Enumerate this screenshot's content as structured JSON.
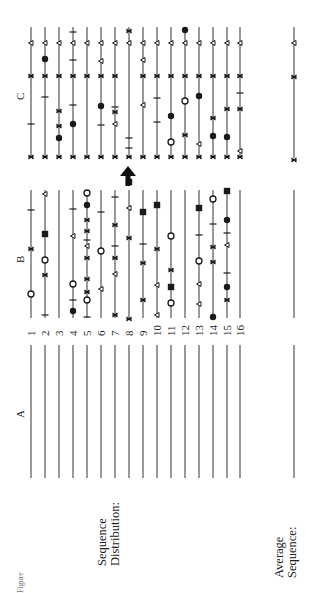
{
  "figure": {
    "orientation": "rotated-90-ccw",
    "panels": {
      "A": {
        "label": "A"
      },
      "B": {
        "label": "B"
      },
      "C": {
        "label": "C"
      }
    },
    "row_labels": [
      "1",
      "2",
      "3",
      "4",
      "5",
      "6",
      "7",
      "8",
      "9",
      "10",
      "11",
      "12",
      "13",
      "14",
      "15",
      "16"
    ],
    "sequence_distribution_label_1": "Sequence",
    "sequence_distribution_label_2": "Distribution:",
    "average_sequence_label_1": "Average",
    "average_sequence_label_2": "Sequence:",
    "caption": "Figure",
    "arrow": {
      "target_row": 8,
      "direction": "up"
    },
    "legend_markers": [
      "filled-circle",
      "open-circle",
      "filled-square",
      "open-triangle",
      "cross-x",
      "tick-bar"
    ],
    "colors": {
      "ink": "#1a1a1a",
      "line": "#555555",
      "background": "#ffffff"
    }
  },
  "geometry": {
    "line_x": [
      31,
      45,
      59,
      73,
      87,
      101,
      115,
      129,
      143,
      157,
      171,
      185,
      199,
      213,
      227,
      240
    ],
    "avg_x": 294,
    "C": {
      "y0": 27,
      "y1": 158
    },
    "B": {
      "y0": 190,
      "y1": 318
    },
    "A": {
      "y0": 345,
      "y1": 478
    }
  },
  "markers": {
    "C": [
      [
        [
          "tri",
          43
        ],
        [
          "x",
          76
        ],
        [
          "bar",
          124
        ],
        [
          "x",
          157
        ]
      ],
      [
        [
          "tri",
          43
        ],
        [
          "dot",
          59
        ],
        [
          "x",
          76
        ],
        [
          "bar",
          97
        ],
        [
          "x",
          157
        ]
      ],
      [
        [
          "tri",
          43
        ],
        [
          "x",
          76
        ],
        [
          "x",
          111
        ],
        [
          "x",
          126
        ],
        [
          "dot",
          138
        ],
        [
          "x",
          157
        ]
      ],
      [
        [
          "bar",
          32
        ],
        [
          "tri",
          43
        ],
        [
          "bar",
          60
        ],
        [
          "x",
          76
        ],
        [
          "bar",
          105
        ],
        [
          "dot",
          124
        ],
        [
          "x",
          157
        ]
      ],
      [
        [
          "tri",
          43
        ],
        [
          "x",
          76
        ],
        [
          "x",
          157
        ]
      ],
      [
        [
          "tri",
          43
        ],
        [
          "tri",
          61
        ],
        [
          "x",
          76
        ],
        [
          "dot",
          106
        ],
        [
          "bar",
          125
        ],
        [
          "x",
          157
        ]
      ],
      [
        [
          "tri",
          43
        ],
        [
          "x",
          76
        ],
        [
          "bar",
          107
        ],
        [
          "x",
          112
        ],
        [
          "tri",
          124
        ],
        [
          "x",
          157
        ]
      ],
      [
        [
          "x",
          31
        ],
        [
          "tri",
          43
        ],
        [
          "bar",
          138
        ],
        [
          "bar",
          148
        ],
        [
          "x",
          157
        ]
      ],
      [
        [
          "tri",
          43
        ],
        [
          "tri",
          60
        ],
        [
          "x",
          76
        ],
        [
          "tri",
          105
        ],
        [
          "x",
          157
        ]
      ],
      [
        [
          "tri",
          43
        ],
        [
          "x",
          76
        ],
        [
          "bar",
          98
        ],
        [
          "bar",
          122
        ],
        [
          "x",
          157
        ]
      ],
      [
        [
          "tri",
          43
        ],
        [
          "x",
          76
        ],
        [
          "dot",
          116
        ],
        [
          "circ",
          142
        ],
        [
          "x",
          157
        ]
      ],
      [
        [
          "dot",
          30
        ],
        [
          "tri",
          43
        ],
        [
          "x",
          76
        ],
        [
          "circ",
          101
        ],
        [
          "x",
          135
        ],
        [
          "x",
          157
        ]
      ],
      [
        [
          "tri",
          43
        ],
        [
          "x",
          76
        ],
        [
          "dot",
          96
        ],
        [
          "tri",
          144
        ],
        [
          "x",
          157
        ]
      ],
      [
        [
          "tri",
          43
        ],
        [
          "x",
          76
        ],
        [
          "x",
          118
        ],
        [
          "dot",
          136
        ],
        [
          "x",
          157
        ]
      ],
      [
        [
          "tri",
          43
        ],
        [
          "x",
          76
        ],
        [
          "x",
          109
        ],
        [
          "dot",
          137
        ],
        [
          "x",
          157
        ]
      ],
      [
        [
          "tri",
          43
        ],
        [
          "x",
          76
        ],
        [
          "bar",
          93
        ],
        [
          "x",
          109
        ],
        [
          "tri",
          151
        ],
        [
          "x",
          157
        ]
      ]
    ],
    "B": [
      [
        [
          "bar",
          210
        ],
        [
          "x",
          249
        ],
        [
          "circ",
          294
        ]
      ],
      [
        [
          "tri",
          194
        ],
        [
          "sq",
          234
        ],
        [
          "circ",
          260
        ],
        [
          "x",
          275
        ],
        [
          "bar",
          315
        ]
      ],
      [],
      [
        [
          "bar",
          209
        ],
        [
          "tri",
          236
        ],
        [
          "circ",
          284
        ],
        [
          "bar",
          300
        ],
        [
          "dot",
          311
        ]
      ],
      [
        [
          "circ",
          193
        ],
        [
          "dot",
          205
        ],
        [
          "x",
          220
        ],
        [
          "x",
          231
        ],
        [
          "bar",
          240
        ],
        [
          "tri",
          246
        ],
        [
          "x",
          258
        ],
        [
          "x",
          279
        ],
        [
          "x",
          292
        ],
        [
          "circ",
          300
        ],
        [
          "bar",
          317
        ]
      ],
      [
        [
          "bar",
          212
        ],
        [
          "circ",
          251
        ],
        [
          "tri",
          289
        ]
      ],
      [
        [
          "bar",
          197
        ],
        [
          "x",
          225
        ],
        [
          "bar",
          246
        ],
        [
          "x",
          258
        ],
        [
          "tri",
          274
        ],
        [
          "x",
          315
        ]
      ],
      [
        [
          "sq",
          182
        ],
        [
          "tri",
          208
        ],
        [
          "x",
          238
        ],
        [
          "x",
          319
        ]
      ],
      [
        [
          "sq",
          212
        ],
        [
          "bar",
          244
        ],
        [
          "x",
          263
        ],
        [
          "x",
          300
        ]
      ],
      [
        [
          "sq",
          205
        ],
        [
          "x",
          249
        ],
        [
          "tri",
          285
        ],
        [
          "tri",
          315
        ]
      ],
      [
        [
          "circ",
          236
        ],
        [
          "x",
          270
        ],
        [
          "sq",
          287
        ],
        [
          "circ",
          303
        ]
      ],
      [],
      [
        [
          "sq",
          208
        ],
        [
          "bar",
          235
        ],
        [
          "circ",
          261
        ],
        [
          "tri",
          284
        ],
        [
          "tri",
          304
        ]
      ],
      [
        [
          "circ",
          199
        ],
        [
          "bar",
          224
        ],
        [
          "x",
          247
        ],
        [
          "x",
          262
        ],
        [
          "dot",
          317
        ]
      ],
      [
        [
          "sq",
          191
        ],
        [
          "dot",
          220
        ],
        [
          "bar",
          233
        ],
        [
          "tri",
          245
        ],
        [
          "bar",
          273
        ],
        [
          "dot",
          287
        ],
        [
          "x",
          300
        ]
      ],
      []
    ],
    "avg": [
      [
        "tri",
        43
      ],
      [
        "x",
        77
      ],
      [
        "x",
        160
      ]
    ]
  },
  "chart_data": {
    "type": "table",
    "title": "Sequence Distribution",
    "panels": [
      "A",
      "B",
      "C"
    ],
    "rows": 16,
    "note": "Panel A shows 16 empty sequence lines; panel B shows scattered marker positions per sequence; panel C shows aligned marker positions; an arrow marks sequence 8 between B and C; Average Sequence shows markers only in panel C (triangle, cross, cross)."
  }
}
